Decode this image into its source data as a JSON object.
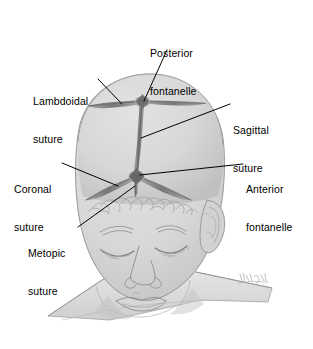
{
  "figure": {
    "background_color": "#ffffff"
  },
  "colors": {
    "skull_fill": "#d6d6d6",
    "skull_shadow": "#b9b9b9",
    "suture_dark": "#7e7e7e",
    "suture_core": "#6a6a6a",
    "skin_fill": "#dcdcdc",
    "line_stroke": "#000000",
    "text": "#000000",
    "outline": "#8c8c8c"
  },
  "labels": [
    {
      "id": "posterior-fontanelle",
      "lines": [
        "Posterior",
        "fontanelle"
      ],
      "text_x": 150,
      "text_y": 22,
      "align": "left",
      "leader": {
        "x1": 167,
        "y1": 50,
        "x2": 144,
        "y2": 101
      }
    },
    {
      "id": "lambdoidal-suture",
      "lines": [
        "Lambdoidal",
        "suture"
      ],
      "text_x": 33,
      "text_y": 70,
      "align": "left",
      "leader": {
        "x1": 98,
        "y1": 79,
        "x2": 122,
        "y2": 104
      }
    },
    {
      "id": "sagittal-suture",
      "lines": [
        "Sagittal",
        "suture"
      ],
      "text_x": 233,
      "text_y": 99,
      "align": "left",
      "leader": {
        "x1": 230,
        "y1": 104,
        "x2": 141,
        "y2": 138
      }
    },
    {
      "id": "coronal-suture",
      "lines": [
        "Coronal",
        "suture"
      ],
      "text_x": 14,
      "text_y": 158,
      "align": "left",
      "leader": {
        "x1": 62,
        "y1": 163,
        "x2": 118,
        "y2": 186
      }
    },
    {
      "id": "anterior-fontanelle",
      "lines": [
        "Anterior",
        "fontanelle"
      ],
      "text_x": 246,
      "text_y": 158,
      "align": "left",
      "leader": {
        "x1": 243,
        "y1": 164,
        "x2": 140,
        "y2": 175
      }
    },
    {
      "id": "metopic-suture",
      "lines": [
        "Metopic",
        "suture"
      ],
      "text_x": 28,
      "text_y": 222,
      "align": "left",
      "leader": {
        "x1": 78,
        "y1": 227,
        "x2": 135,
        "y2": 186
      }
    }
  ],
  "anatomy": {
    "skull_label": "cranial vault",
    "sutures": [
      "sagittal",
      "coronal",
      "lambdoidal",
      "metopic"
    ],
    "fontanelles": [
      "anterior",
      "posterior"
    ],
    "face_features": [
      "closed-eyes",
      "eyebrows",
      "nose",
      "mouth",
      "ear",
      "hair-wisps"
    ],
    "signature": "artist signature"
  }
}
